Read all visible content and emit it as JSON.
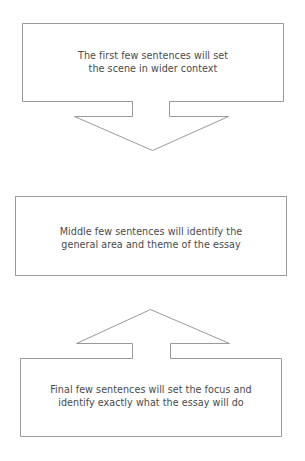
{
  "diagram": {
    "type": "inverted-pyramid-introduction-flow",
    "colors": {
      "background": "#ffffff",
      "stroke": "#9a9a9a",
      "text": "#4a4a4a"
    },
    "boxes": [
      {
        "id": "top",
        "lines": [
          "The first few sentences will set",
          "the scene in wider context"
        ],
        "connector": "arrow-down"
      },
      {
        "id": "middle",
        "lines": [
          "Middle few sentences will identify the",
          "general area and theme of the essay"
        ],
        "connector": "none"
      },
      {
        "id": "bottom",
        "lines": [
          "Final few sentences will set the focus and",
          "identify exactly what the essay will do"
        ],
        "connector": "arrow-up"
      }
    ]
  }
}
